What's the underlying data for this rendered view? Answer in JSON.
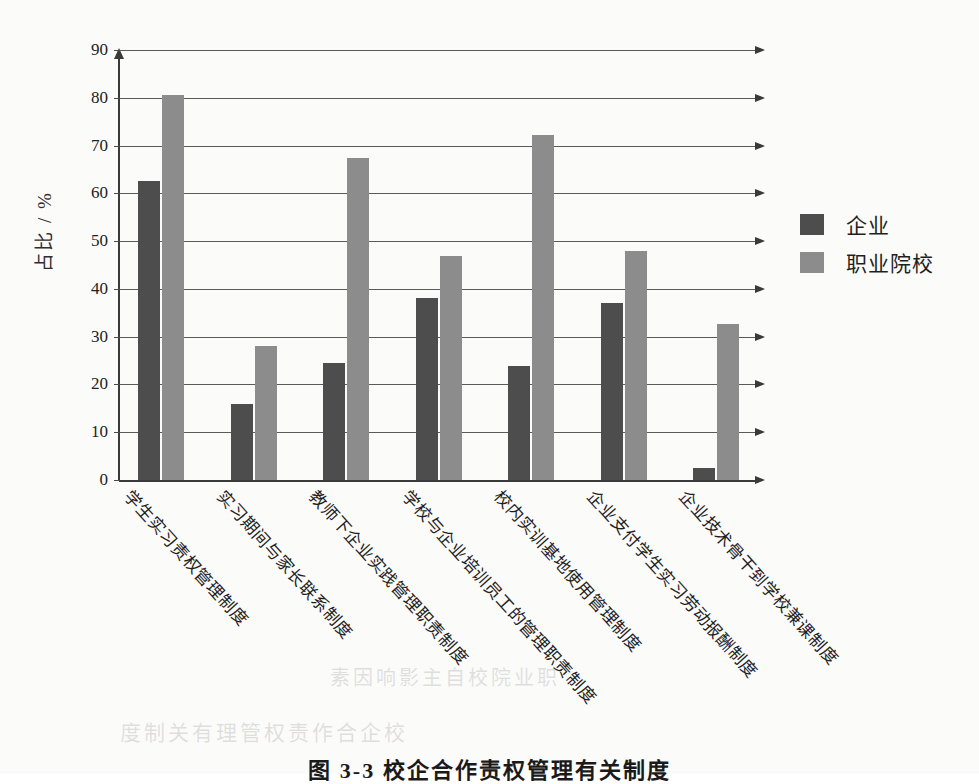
{
  "chart_data": {
    "type": "bar",
    "title": "",
    "xlabel": "",
    "ylabel": "占比 / %",
    "ylim": [
      0,
      90
    ],
    "yticks": [
      0,
      10,
      20,
      30,
      40,
      50,
      60,
      70,
      80,
      90
    ],
    "grid": true,
    "legend_position": "right",
    "categories": [
      "学生实习责权管理制度",
      "实习期间与家长联系制度",
      "教师下企业实践管理职责制度",
      "学校与企业培训员工的管理职责制度",
      "校内实训基地使用管理制度",
      "企业支付学生实习劳动报酬制度",
      "企业技术骨干到学校兼课制度"
    ],
    "series": [
      {
        "name": "企业",
        "color": "#4d4d4d",
        "values": [
          62.5,
          16.0,
          24.5,
          38.0,
          23.8,
          37.0,
          2.5
        ]
      },
      {
        "name": "职业院校",
        "color": "#8c8c8c",
        "values": [
          80.5,
          28.0,
          67.5,
          46.8,
          72.3,
          48.0,
          32.7
        ]
      }
    ]
  },
  "legend": {
    "items": [
      {
        "label": "企业",
        "color": "#4d4d4d"
      },
      {
        "label": "职业院校",
        "color": "#8c8c8c"
      }
    ]
  },
  "caption": {
    "text": "图 3-3  校企合作责权管理有关制度"
  },
  "ghost_text": {
    "line1": "素因响影主自校院业职",
    "line2": "度制关有理管权责作合企校"
  }
}
